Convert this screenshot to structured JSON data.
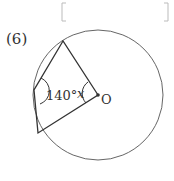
{
  "answer_box": {
    "content": ""
  },
  "problem": {
    "number": "(6)",
    "angle_label": "140°",
    "unknown_label": "x",
    "center_label": "O"
  },
  "colors": {
    "stroke": "#333333",
    "circle": "#666666",
    "bracket": "#bbbbbb"
  }
}
